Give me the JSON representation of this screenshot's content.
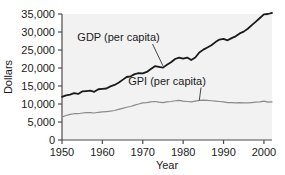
{
  "chart_data": {
    "type": "line",
    "title": "",
    "subtitle": "",
    "xlabel": "Year",
    "ylabel": "Dollars",
    "xlim": [
      1950,
      2002
    ],
    "ylim": [
      0,
      35000
    ],
    "grid": false,
    "legend_position": "inline-annotations",
    "x_ticks": [
      "1950",
      "1960",
      "1970",
      "1980",
      "1990",
      "2000"
    ],
    "x_tick_values": [
      1950,
      1960,
      1970,
      1980,
      1990,
      2000
    ],
    "y_ticks": [
      "0",
      "5,000",
      "10,000",
      "15,000",
      "20,000",
      "25,000",
      "30,000",
      "35,000"
    ],
    "y_tick_values": [
      0,
      5000,
      10000,
      15000,
      20000,
      25000,
      30000,
      35000
    ],
    "x": [
      1950,
      1951,
      1952,
      1953,
      1954,
      1955,
      1956,
      1957,
      1958,
      1959,
      1960,
      1961,
      1962,
      1963,
      1964,
      1965,
      1966,
      1967,
      1968,
      1969,
      1970,
      1971,
      1972,
      1973,
      1974,
      1975,
      1976,
      1977,
      1978,
      1979,
      1980,
      1981,
      1982,
      1983,
      1984,
      1985,
      1986,
      1987,
      1988,
      1989,
      1990,
      1991,
      1992,
      1993,
      1994,
      1995,
      1996,
      1997,
      1998,
      1999,
      2000,
      2001,
      2002
    ],
    "series": [
      {
        "name": "GDP (per capita)",
        "color": "#1a1a1a",
        "values": [
          12000,
          12400,
          12600,
          13000,
          12800,
          13500,
          13600,
          13700,
          13400,
          14100,
          14200,
          14300,
          14900,
          15300,
          15900,
          16700,
          17500,
          17700,
          18300,
          18600,
          18500,
          18900,
          19700,
          20500,
          20300,
          20100,
          20900,
          21600,
          22500,
          22900,
          22600,
          22900,
          22200,
          22900,
          24300,
          25100,
          25700,
          26300,
          27200,
          27900,
          28100,
          27700,
          28300,
          28800,
          29600,
          30100,
          30900,
          31900,
          32900,
          33900,
          34900,
          35000,
          35300
        ]
      },
      {
        "name": "GPI (per capita)",
        "color": "#8a8a8a",
        "values": [
          6400,
          6800,
          7100,
          7300,
          7300,
          7500,
          7600,
          7600,
          7500,
          7700,
          7800,
          7900,
          8000,
          8200,
          8500,
          8800,
          9100,
          9300,
          9700,
          10000,
          10300,
          10400,
          10600,
          10700,
          10500,
          10400,
          10600,
          10700,
          10900,
          11000,
          10800,
          10700,
          10600,
          10800,
          11000,
          11100,
          11000,
          10900,
          10800,
          10700,
          10600,
          10400,
          10400,
          10300,
          10400,
          10300,
          10300,
          10400,
          10500,
          10600,
          10800,
          10500,
          10600
        ]
      }
    ],
    "annotations": [
      {
        "text": "GDP (per capita)",
        "target_x": 1975,
        "target_y": 20600,
        "label_x": 1964,
        "label_y": 27500
      },
      {
        "text": "GPI (per capita)",
        "target_x": 1984,
        "target_y": 11000,
        "label_x": 1976,
        "label_y": 15400
      }
    ]
  },
  "figure": {
    "plot_background": "#f2f2f2",
    "axis_color": "#4d4d4d",
    "text_color": "#1a1a1a"
  }
}
